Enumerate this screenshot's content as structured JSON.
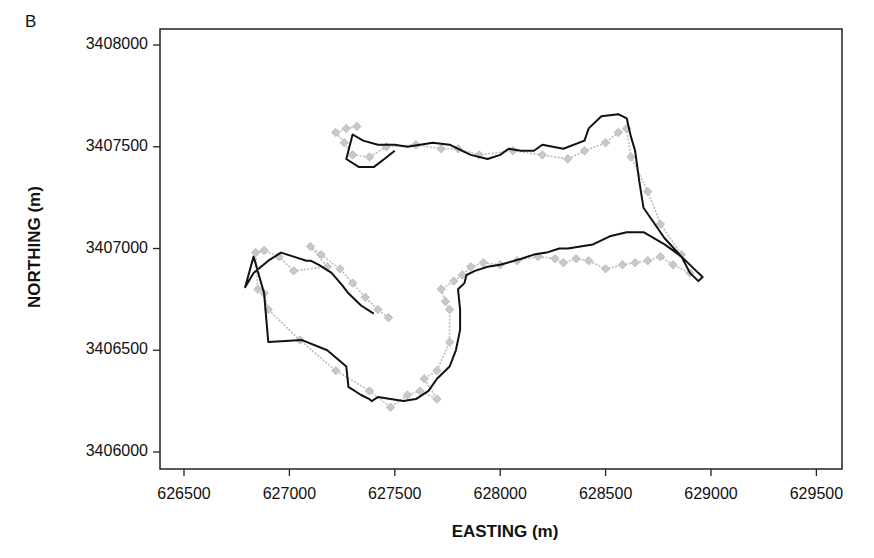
{
  "panel_label": "B",
  "chart_data": {
    "type": "line",
    "title": "",
    "panel": "B",
    "xlabel": "EASTING (m)",
    "ylabel": "NORTHING (m)",
    "xlim": [
      626420,
      629620
    ],
    "ylim": [
      3405920,
      3408080
    ],
    "xticks": [
      626500,
      627000,
      627500,
      628000,
      628500,
      629000,
      629500
    ],
    "yticks": [
      3406000,
      3406500,
      3407000,
      3407500,
      3408000
    ],
    "xtick_labels": [
      "626500",
      "627000",
      "627500",
      "628000",
      "628500",
      "629000",
      "629500"
    ],
    "ytick_labels": [
      "3406000",
      "3406500",
      "3407000",
      "3407500",
      "3408000"
    ],
    "grid": false,
    "legend": null,
    "series": [
      {
        "name": "track-black-line",
        "style": "solid black line",
        "color": "#111111",
        "x": [
          627400,
          627340,
          627280,
          627250,
          627200,
          627140,
          627100,
          627080,
          627020,
          626960,
          626900,
          626830,
          626790,
          626830,
          626880,
          626900,
          627060,
          627180,
          627270,
          627280,
          627340,
          627380,
          627390,
          627420,
          627480,
          627540,
          627600,
          627660,
          627700,
          627760,
          627790,
          627810,
          627810,
          627800,
          627830,
          627840,
          627880,
          627940,
          628000,
          628100,
          628160,
          628220,
          628280,
          628320,
          628440,
          628520,
          628600,
          628680,
          628780,
          628860,
          628920,
          628960,
          628940,
          628900,
          628860,
          628780,
          628680,
          628660,
          628640,
          628620,
          628600,
          628560,
          628480,
          628420,
          628400,
          628300,
          628200,
          628160,
          628100,
          628040,
          628000,
          627940,
          627860,
          627820,
          627760,
          627680,
          627620,
          627560,
          627500,
          627460,
          627420,
          627350,
          627300,
          627270,
          627330,
          627400,
          627450,
          627500
        ],
        "y": [
          3406680,
          3406720,
          3406780,
          3406820,
          3406880,
          3406920,
          3406940,
          3406940,
          3406960,
          3406980,
          3406940,
          3406880,
          3406810,
          3406960,
          3406780,
          3406540,
          3406550,
          3406500,
          3406420,
          3406320,
          3406280,
          3406260,
          3406250,
          3406270,
          3406260,
          3406250,
          3406260,
          3406300,
          3406360,
          3406420,
          3406500,
          3406600,
          3406700,
          3406800,
          3406830,
          3406870,
          3406890,
          3406910,
          3406920,
          3406950,
          3406970,
          3406980,
          3407000,
          3407000,
          3407020,
          3407060,
          3407080,
          3407080,
          3407020,
          3406960,
          3406900,
          3406860,
          3406840,
          3406880,
          3406960,
          3407050,
          3407200,
          3407330,
          3407480,
          3407550,
          3407640,
          3407660,
          3407650,
          3407590,
          3407530,
          3407490,
          3407510,
          3407480,
          3407480,
          3407490,
          3407460,
          3407440,
          3407460,
          3407480,
          3407510,
          3407520,
          3407510,
          3407500,
          3407510,
          3407510,
          3407510,
          3407530,
          3407560,
          3407440,
          3407400,
          3407400,
          3407440,
          3407480
        ]
      },
      {
        "name": "fixes-gray-diamonds",
        "style": "gray dotted line with diamond markers",
        "color": "#bdbdbd",
        "x": [
          627470,
          627420,
          627360,
          627300,
          627240,
          627150,
          627100,
          627180,
          627020,
          626950,
          626880,
          626840,
          626850,
          626880,
          626900,
          627050,
          627220,
          627380,
          627480,
          627560,
          627620,
          627700,
          627640,
          627700,
          627760,
          627760,
          627740,
          627720,
          627780,
          627820,
          627860,
          627920,
          628000,
          628080,
          628180,
          628260,
          628300,
          628360,
          628420,
          628500,
          628580,
          628640,
          628700,
          628760,
          628820,
          628900,
          628860,
          628760,
          628700,
          628620,
          628600,
          628560,
          628500,
          628400,
          628320,
          628200,
          628060,
          627900,
          627800,
          627720,
          627600,
          627460,
          627380,
          627300,
          627260,
          627220,
          627270,
          627320
        ],
        "y": [
          3406660,
          3406700,
          3406760,
          3406830,
          3406900,
          3406970,
          3407010,
          3406910,
          3406890,
          3406960,
          3406990,
          3406980,
          3406800,
          3406780,
          3406700,
          3406550,
          3406400,
          3406300,
          3406220,
          3406280,
          3406300,
          3406260,
          3406360,
          3406400,
          3406540,
          3406700,
          3406740,
          3406800,
          3406840,
          3406870,
          3406910,
          3406930,
          3406920,
          3406940,
          3406960,
          3406950,
          3406930,
          3406950,
          3406940,
          3406900,
          3406920,
          3406930,
          3406940,
          3406960,
          3406920,
          3406880,
          3406970,
          3407120,
          3407280,
          3407450,
          3407590,
          3407570,
          3407520,
          3407480,
          3407440,
          3407460,
          3407480,
          3407460,
          3407490,
          3407490,
          3407510,
          3407500,
          3407450,
          3407460,
          3407520,
          3407570,
          3407590,
          3407600
        ]
      }
    ]
  }
}
